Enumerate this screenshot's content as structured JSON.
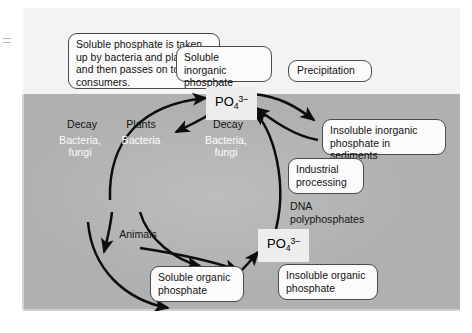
{
  "figure": {
    "colors": {
      "sky_band": "#f3f3f3",
      "ground_band": "#b0b0b0",
      "box_fill": "#fbfbfb",
      "box_border": "#4a4a4a",
      "chip_fill": "#ededed",
      "arrow": "#0d0d0d",
      "text_dark": "#141414",
      "text_light": "#fdfdfd"
    }
  },
  "callouts": {
    "annotation": "Soluble phosphate is taken up by bacteria and plants, and then passes on to consumers.",
    "soluble_inorganic": "Soluble inorganic phosphate",
    "precipitation": "Precipitation",
    "insoluble_inorganic": "Insoluble inorganic phosphate in sediments",
    "industrial_processing": "Industrial processing",
    "soluble_organic": "Soluble organic phosphate",
    "insoluble_organic": "Insoluble organic phosphate"
  },
  "chips": {
    "phosphate_upper": {
      "formula": "PO",
      "sub": "4",
      "sup": "3–"
    },
    "phosphate_lower": {
      "formula": "PO",
      "sub": "4",
      "sup": "3–"
    }
  },
  "labels": {
    "decay_left": "Decay",
    "bacteria_fungi_left_line1": "Bacteria,",
    "bacteria_fungi_left_line2": "fungi",
    "plants": "Plants",
    "bacteria_center": "Bacteria",
    "decay_center": "Decay",
    "bacteria_fungi_center_line1": "Bacteria,",
    "bacteria_fungi_center_line2": "fungi",
    "animals": "Animals",
    "dna_line1": "DNA",
    "dna_line2": "polyphosphates"
  },
  "arrows": [
    {
      "name": "plants-to-upper-phosphate",
      "from": "Plants",
      "to": "PO4 3- (upper)"
    },
    {
      "name": "upper-phosphate-to-plants",
      "from": "PO4 3- (upper)",
      "to": "Plants"
    },
    {
      "name": "upper-phosphate-to-insoluble-inorganic",
      "from": "PO4 3- (upper)",
      "to": "Insoluble inorganic phosphate in sediments"
    },
    {
      "name": "insoluble-inorganic-to-upper-phosphate",
      "from": "Insoluble inorganic phosphate in sediments",
      "to": "PO4 3- (upper)"
    },
    {
      "name": "lower-phosphate-to-upper-phosphate",
      "from": "PO4 3- (lower)",
      "to": "PO4 3- (upper)"
    },
    {
      "name": "plants-to-animals",
      "from": "Plants",
      "to": "Animals"
    },
    {
      "name": "bacteria-to-lower-phosphate",
      "from": "Bacteria",
      "to": "PO4 3- (lower)"
    },
    {
      "name": "animals-to-lower-phosphate",
      "from": "Animals",
      "to": "PO4 3- (lower)"
    },
    {
      "name": "soluble-organic-to-lower-phosphate",
      "from": "Soluble organic phosphate",
      "to": "PO4 3- (lower)"
    },
    {
      "name": "decay-to-soluble-organic",
      "from": "Decay (animals)",
      "to": "Soluble organic phosphate"
    },
    {
      "name": "decay-left-to-soluble-organic",
      "from": "Decay (left)",
      "to": "Soluble organic phosphate"
    }
  ]
}
